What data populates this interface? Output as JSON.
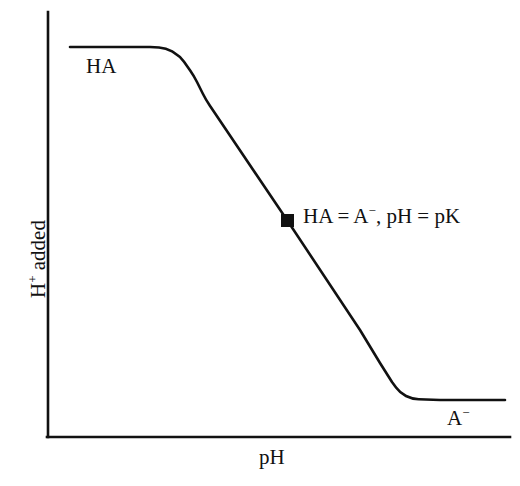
{
  "figure": {
    "background_color": "#ffffff",
    "ink_color": "#111111"
  },
  "axes": {
    "x_title": "pH",
    "y_title_main": "H",
    "y_title_super": "+",
    "y_title_rest": " added",
    "x_title_full": "pH",
    "y_title_full": "H+ added"
  },
  "annotations": {
    "upper_plateau_label": "HA",
    "lower_plateau_label_main": "A",
    "lower_plateau_label_super": "−",
    "lower_plateau_label_full": "A−",
    "midpoint_part1": "HA = A",
    "midpoint_super": "−",
    "midpoint_part2": ", pH = pK",
    "midpoint_full": "HA = A−, pH = pK"
  },
  "chart_data": {
    "type": "line",
    "title": "",
    "subtitle": "",
    "xlabel": "pH",
    "ylabel": "H+ added",
    "xlim": [
      0,
      100
    ],
    "ylim": [
      0,
      100
    ],
    "grid": false,
    "legend": "none",
    "axis_ticks": {
      "x": [],
      "y": []
    },
    "series": [
      {
        "name": "titration-curve",
        "color": "#111111",
        "line_width": 2.6,
        "points_px": [
          [
            70,
            47
          ],
          [
            150,
            47
          ],
          [
            166,
            48
          ],
          [
            180,
            56
          ],
          [
            194,
            76
          ],
          [
            206,
            100
          ],
          [
            287,
            220
          ],
          [
            360,
            330
          ],
          [
            380,
            363
          ],
          [
            392,
            382
          ],
          [
            400,
            393
          ],
          [
            412,
            399
          ],
          [
            440,
            400
          ],
          [
            505,
            400
          ]
        ],
        "points_data": [
          [
            5,
            95
          ],
          [
            22,
            95
          ],
          [
            25,
            95
          ],
          [
            29,
            93
          ],
          [
            32,
            88
          ],
          [
            34,
            83
          ],
          [
            52,
            57
          ],
          [
            68,
            33
          ],
          [
            72,
            26
          ],
          [
            74,
            22
          ],
          [
            76,
            19
          ],
          [
            79,
            18
          ],
          [
            85,
            18
          ],
          [
            99,
            18
          ]
        ]
      }
    ],
    "markers": [
      {
        "name": "midpoint-marker",
        "shape": "square",
        "x_px": 287,
        "y_px": 220,
        "x_data": 52,
        "y_data": 57,
        "size_px": 13,
        "color": "#111111",
        "label": "HA = A−, pH = pK"
      }
    ],
    "axis_geometry_px": {
      "y_axis_x": 48,
      "y_axis_top": 12,
      "y_axis_bottom": 437,
      "x_axis_y": 437,
      "x_axis_left": 48,
      "x_axis_right": 510,
      "line_width": 2.6
    }
  }
}
